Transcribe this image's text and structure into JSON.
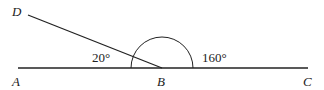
{
  "diagram": {
    "type": "geometry-angles",
    "points": {
      "A": {
        "label": "A",
        "x": 18,
        "y": 68
      },
      "B": {
        "label": "B",
        "x": 162,
        "y": 68
      },
      "C": {
        "label": "C",
        "x": 308,
        "y": 68
      },
      "D": {
        "label": "D",
        "x": 28,
        "y": 15
      }
    },
    "segments": [
      {
        "from": "A",
        "to": "C"
      },
      {
        "from": "D",
        "to": "B"
      }
    ],
    "angles": [
      {
        "label": "20°",
        "vertex": "B",
        "between": [
          "D",
          "A"
        ]
      },
      {
        "label": "160°",
        "vertex": "B",
        "between": [
          "D",
          "C"
        ]
      }
    ],
    "arc": {
      "center": "B",
      "radius": 31,
      "from_deg": 0,
      "to_deg": 180
    },
    "colors": {
      "stroke": "#222222",
      "background": "#ffffff"
    }
  },
  "labels": {
    "A": "A",
    "B": "B",
    "C": "C",
    "D": "D",
    "angle_small": "20°",
    "angle_large": "160°"
  }
}
